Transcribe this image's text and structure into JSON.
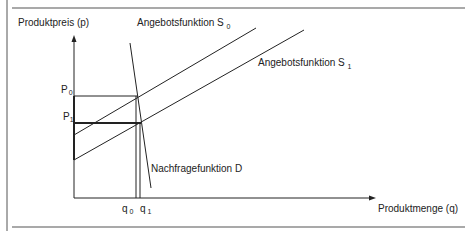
{
  "diagram": {
    "y_axis_label": "Produktpreis (p)",
    "x_axis_label": "Produktmenge (q)",
    "supply0_label": "Angebotsfunktion S",
    "supply0_sub": "0",
    "supply1_label": "Angebotsfunktion S",
    "supply1_sub": "1",
    "demand_label": "Nachfragefunktion D",
    "p0_label": "P",
    "p0_sub": "0",
    "p1_label": "P",
    "p1_sub": "1",
    "q0_label": "q",
    "q0_sub": "0",
    "q1_label": "q",
    "q1_sub": "1"
  }
}
